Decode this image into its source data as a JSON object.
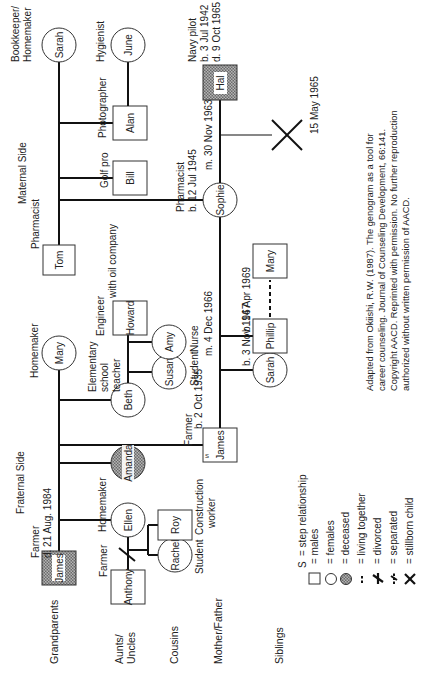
{
  "sections": {
    "fraternal": "Fraternal Side",
    "maternal": "Maternal Side"
  },
  "rows": {
    "grandparents": "Grandparents",
    "aunts_uncles_1": "Aunts/",
    "aunts_uncles_2": "Uncles",
    "cousins": "Cousins",
    "mother_father": "Mother/Father",
    "siblings": "Siblings"
  },
  "people": {
    "james_gf": {
      "name": "James",
      "sex": "male",
      "deceased": true,
      "label1": "Farmer",
      "label2": "d. 21 Aug. 1984"
    },
    "mary_gm": {
      "name": "Mary",
      "sex": "female",
      "label1": "Homemaker"
    },
    "ellen": {
      "name": "Ellen",
      "sex": "female",
      "label1": "Homemaker"
    },
    "amanda": {
      "name": "Amanda",
      "sex": "female",
      "deceased": true
    },
    "beth": {
      "name": "Beth",
      "sex": "female",
      "label1": "Elementary",
      "label2": "school",
      "label3": "teacher"
    },
    "howard": {
      "name": "Howard",
      "sex": "male",
      "label1": "Engineer",
      "label2": "with oil company"
    },
    "susan": {
      "name": "Susan",
      "sex": "female",
      "label1": "Student"
    },
    "amy": {
      "name": "Amy",
      "sex": "female",
      "label1": "Nurse"
    },
    "anthony": {
      "name": "Anthony",
      "sex": "male",
      "label1": "Farmer"
    },
    "rachel": {
      "name": "Rachel",
      "sex": "female",
      "label1": "Student"
    },
    "roy": {
      "name": "Roy",
      "sex": "male",
      "label1": "Construction",
      "label2": "worker"
    },
    "james_father": {
      "name": "James",
      "sex": "male",
      "step": "S",
      "label1": "Farmer",
      "label2": "b. 2 Oct 1935"
    },
    "tom": {
      "name": "Tom",
      "sex": "male",
      "label1": "Pharmacist"
    },
    "sarah_gm": {
      "name": "Sarah",
      "sex": "female",
      "label1": "Bookkeeper/",
      "label2": "Homemaker"
    },
    "bill": {
      "name": "Bill",
      "sex": "male",
      "label1": "Golf pro"
    },
    "alan": {
      "name": "Alan",
      "sex": "male",
      "label1": "Photographer"
    },
    "june": {
      "name": "June",
      "sex": "female",
      "label1": "Hygienist"
    },
    "sophie": {
      "name": "Sophie",
      "sex": "female",
      "label1": "Pharmacist",
      "label2": "b. 12 Jul 1945"
    },
    "hal": {
      "name": "Hal",
      "sex": "male",
      "deceased": true,
      "label1": "Navy pilot",
      "label2": "b. 3 Jul 1942",
      "label3": "d. 9 Oct 1965"
    },
    "sarah_sib": {
      "name": "Sarah",
      "sex": "female",
      "label1": "b. 3 Nov 1967"
    },
    "phillip": {
      "name": "Phillip",
      "sex": "male",
      "label1": "b. 14 Apr 1969"
    },
    "mary_partner": {
      "name": "Mary",
      "sex": "female"
    }
  },
  "events": {
    "marriage_james_sophie": "m. 4 Dec 1966",
    "marriage_sophie_hal": "m. 30 Nov 1963",
    "stillborn_date": "15 May 1965"
  },
  "legend": [
    {
      "symbol": "S",
      "label": "= step relationship"
    },
    {
      "symbol": "square",
      "label": "= males"
    },
    {
      "symbol": "circle",
      "label": "= females"
    },
    {
      "symbol": "shaded-circle",
      "label": "= deceased"
    },
    {
      "symbol": "dashed-line",
      "label": "= living together"
    },
    {
      "symbol": "divorced-mark",
      "label": "= divorced"
    },
    {
      "symbol": "separated-mark",
      "label": "= separated"
    },
    {
      "symbol": "x-mark",
      "label": "= stillborn child"
    }
  ],
  "citation": [
    "Adapted from Okiishi, R.W. (1987). The genogram as a tool for",
    "career counseling. Journal of Counseling Development, 66:141.",
    "Copyright AACD. Reprinted with permission. No further reproduction",
    "authorized without written permission of AACD."
  ],
  "colors": {
    "line": "#111111",
    "shade": "#8a8a8a",
    "text": "#222222",
    "background": "#ffffff"
  }
}
